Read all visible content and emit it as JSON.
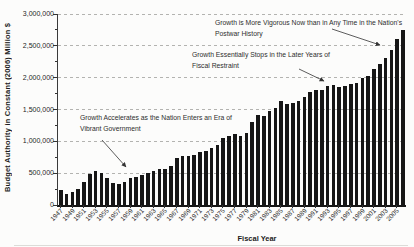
{
  "chart_data": {
    "type": "bar",
    "title": "",
    "xlabel": "Fiscal Year",
    "ylabel": "Budget Authority in Constant (2006) Million $",
    "ylim": [
      0,
      3000000
    ],
    "grid": "horizontal dashed every 500,000",
    "legend_position": "none",
    "bar_color": "#161616",
    "yticks": [
      {
        "value": 0,
        "label": "0"
      },
      {
        "value": 500000,
        "label": "500,000"
      },
      {
        "value": 1000000,
        "label": "1,000,000"
      },
      {
        "value": 1500000,
        "label": "1,500,000"
      },
      {
        "value": 2000000,
        "label": "2,000,000"
      },
      {
        "value": 2500000,
        "label": "2,500,000"
      },
      {
        "value": 3000000,
        "label": "3,000,000"
      }
    ],
    "xtick_labels": [
      "1947",
      "1949",
      "1951",
      "1953",
      "1955",
      "1957",
      "1959",
      "1961",
      "1963",
      "1965",
      "1967",
      "1969",
      "1971",
      "1973",
      "1975",
      "1977",
      "1979",
      "1981",
      "1983",
      "1985",
      "1987",
      "1989",
      "1991",
      "1993",
      "1995",
      "1997",
      "1999",
      "2001",
      "2003",
      "2005"
    ],
    "categories": [
      1947,
      1948,
      1949,
      1950,
      1951,
      1952,
      1953,
      1954,
      1955,
      1956,
      1957,
      1958,
      1959,
      1960,
      1961,
      1962,
      1963,
      1964,
      1965,
      1966,
      1967,
      1968,
      1969,
      1970,
      1971,
      1972,
      1973,
      1974,
      1975,
      1976,
      1977,
      1978,
      1979,
      1980,
      1981,
      1982,
      1983,
      1984,
      1985,
      1986,
      1987,
      1988,
      1989,
      1990,
      1991,
      1992,
      1993,
      1994,
      1995,
      1996,
      1997,
      1998,
      1999,
      2000,
      2001,
      2002,
      2003,
      2004,
      2005,
      2006
    ],
    "values": [
      230000,
      170000,
      210000,
      250000,
      360000,
      480000,
      530000,
      500000,
      420000,
      350000,
      330000,
      360000,
      430000,
      440000,
      465000,
      510000,
      540000,
      560000,
      565000,
      620000,
      745000,
      770000,
      770000,
      780000,
      835000,
      850000,
      890000,
      950000,
      1050000,
      1080000,
      1110000,
      1090000,
      1130000,
      1310000,
      1410000,
      1400000,
      1475000,
      1520000,
      1630000,
      1590000,
      1600000,
      1630000,
      1690000,
      1770000,
      1800000,
      1810000,
      1870000,
      1880000,
      1860000,
      1870000,
      1900000,
      1910000,
      2000000,
      2030000,
      2130000,
      2215000,
      2310000,
      2440000,
      2600000,
      2750000
    ],
    "annotations": [
      {
        "text": "Growth is More Vigorous Now than in Any Time in the Nation's Postwar History",
        "arrow_points_to_year": 2004
      },
      {
        "text": "Growth Essentially Stops in the Later Years of Fiscal Restraint",
        "arrow_points_to_year": 1993
      },
      {
        "text": "Growth Accelerates as the Nation Enters an Era of Vibrant Government",
        "arrow_points_to_year": 1959
      }
    ]
  }
}
